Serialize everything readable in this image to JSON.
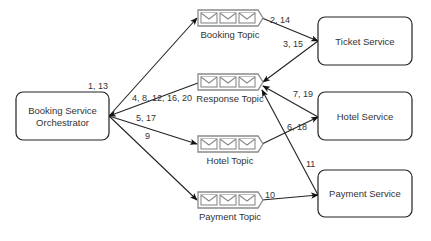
{
  "services": [
    {
      "id": "orchestrator",
      "lines": [
        "Booking Service",
        "Orchestrator"
      ],
      "x": 16,
      "y": 92,
      "w": 93,
      "h": 48
    },
    {
      "id": "ticket",
      "lines": [
        "Ticket Service"
      ],
      "x": 318,
      "y": 17,
      "w": 94,
      "h": 48
    },
    {
      "id": "hotel",
      "lines": [
        "Hotel Service"
      ],
      "x": 318,
      "y": 92,
      "w": 94,
      "h": 48
    },
    {
      "id": "payment",
      "lines": [
        "Payment Service"
      ],
      "x": 318,
      "y": 170,
      "w": 94,
      "h": 47
    }
  ],
  "topics": [
    {
      "id": "booking-topic",
      "label": "Booking Topic",
      "x": 198,
      "y": 10
    },
    {
      "id": "response-topic",
      "label": "Response Topic",
      "x": 198,
      "y": 74
    },
    {
      "id": "hotel-topic",
      "label": "Hotel Topic",
      "x": 198,
      "y": 136
    },
    {
      "id": "payment-topic",
      "label": "Payment Topic",
      "x": 198,
      "y": 192
    }
  ],
  "edges": [
    {
      "id": "e1",
      "label": "1, 13",
      "from": [
        109,
        116
      ],
      "to": [
        197,
        18
      ],
      "label_pos": [
        88,
        89
      ]
    },
    {
      "id": "e2",
      "label": "2, 14",
      "from": [
        262,
        18
      ],
      "to": [
        318,
        41
      ],
      "label_pos": [
        270,
        23
      ]
    },
    {
      "id": "e3",
      "label": "3, 15",
      "from": [
        318,
        41
      ],
      "to": [
        263,
        82
      ],
      "label_pos": [
        283,
        47
      ]
    },
    {
      "id": "e4",
      "label": "4, 8, 12, 16, 20",
      "from": [
        198,
        83
      ],
      "to": [
        109,
        116
      ],
      "label_pos": [
        132,
        101
      ]
    },
    {
      "id": "e5",
      "label": "5, 17",
      "from": [
        109,
        116
      ],
      "to": [
        197,
        144
      ],
      "label_pos": [
        136,
        121
      ]
    },
    {
      "id": "e6",
      "label": "6, 18",
      "from": [
        262,
        144
      ],
      "to": [
        318,
        117
      ],
      "label_pos": [
        287,
        130
      ]
    },
    {
      "id": "e7",
      "label": "7, 19",
      "from": [
        318,
        117
      ],
      "to": [
        263,
        86
      ],
      "label_pos": [
        293,
        97
      ]
    },
    {
      "id": "e9",
      "label": "9",
      "from": [
        109,
        116
      ],
      "to": [
        197,
        200
      ],
      "label_pos": [
        145,
        139
      ]
    },
    {
      "id": "e10",
      "label": "10",
      "from": [
        262,
        200
      ],
      "to": [
        318,
        195
      ],
      "label_pos": [
        265,
        198
      ]
    },
    {
      "id": "e11",
      "label": "11",
      "from": [
        318,
        195
      ],
      "to": [
        262,
        90
      ],
      "label_pos": [
        306,
        167
      ]
    }
  ],
  "colors": {
    "stroke": "#222222",
    "topic_stroke": "#8a8a8a",
    "text": "#333333",
    "background": "#ffffff"
  }
}
